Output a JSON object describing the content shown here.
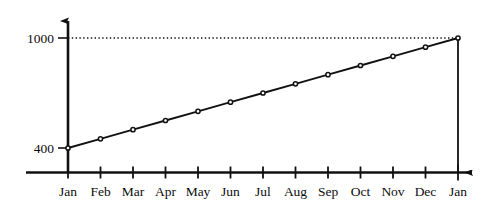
{
  "chart_data": {
    "type": "line",
    "title": "",
    "subtitle": "",
    "xlabel": "",
    "ylabel": "",
    "categories": [
      "Jan",
      "Feb",
      "Mar",
      "Apr",
      "May",
      "Jun",
      "Jul",
      "Aug",
      "Sep",
      "Oct",
      "Nov",
      "Dec",
      "Jan"
    ],
    "values": [
      400,
      450,
      500,
      550,
      600,
      650,
      700,
      750,
      800,
      850,
      900,
      950,
      1000
    ],
    "series": [
      {
        "name": "",
        "values": [
          400,
          450,
          500,
          550,
          600,
          650,
          700,
          750,
          800,
          850,
          900,
          950,
          1000
        ]
      }
    ],
    "x_tick_labels": [
      "Jan",
      "Feb",
      "Mar",
      "Apr",
      "May",
      "Jun",
      "Jul",
      "Aug",
      "Sep",
      "Oct",
      "Nov",
      "Dec",
      "Jan"
    ],
    "y_tick_labels": [
      "1000",
      "400"
    ],
    "y_tick_values": [
      1000,
      400
    ],
    "ylim": [
      400,
      1000
    ],
    "xlim": [
      0,
      12
    ],
    "grid": false,
    "legend": false,
    "legend_position": "none",
    "markers": "circle",
    "line_color": "#111111",
    "marker_color": "#111111",
    "axis_color": "#111111",
    "background_color": "#ffffff",
    "annotations": [
      {
        "name": "reference-line-1000",
        "type": "horizontal-dotted-line",
        "value": 1000,
        "label": ""
      },
      {
        "name": "drop-line-final-jan",
        "type": "vertical-solid-line",
        "at_category": "Jan",
        "from": 1000,
        "to": 400,
        "label": ""
      }
    ]
  },
  "axes": {
    "y_top_label": "1000",
    "y_bottom_label": "400",
    "x_labels": {
      "0": "Jan",
      "1": "Feb",
      "2": "Mar",
      "3": "Apr",
      "4": "May",
      "5": "Jun",
      "6": "Jul",
      "7": "Aug",
      "8": "Sep",
      "9": "Oct",
      "10": "Nov",
      "11": "Dec",
      "12": "Jan"
    }
  }
}
